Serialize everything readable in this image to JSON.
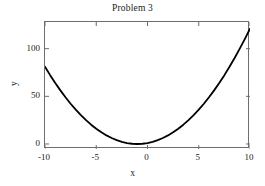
{
  "chart_data": {
    "type": "line",
    "title": "Problem 3",
    "xlabel": "x",
    "ylabel": "y",
    "xlim": [
      -10,
      10
    ],
    "ylim": [
      -5.25,
      128.0
    ],
    "xticks": [
      -10,
      -5,
      0,
      5,
      10
    ],
    "xtick_labels": [
      "-10",
      "-5",
      "0",
      "5",
      "10"
    ],
    "yticks": [
      0,
      50,
      100
    ],
    "ytick_labels": [
      "0",
      "50",
      "100"
    ],
    "grid": false,
    "legend": null,
    "series": [
      {
        "name": "y = (x + 1)^2",
        "color": "#000000",
        "linewidth": 1.8,
        "x": [
          -10,
          -9.5,
          -9,
          -8.5,
          -8,
          -7.5,
          -7,
          -6.5,
          -6,
          -5.5,
          -5,
          -4.5,
          -4,
          -3.5,
          -3,
          -2.5,
          -2,
          -1.5,
          -1,
          -0.5,
          0,
          0.5,
          1,
          1.5,
          2,
          2.5,
          3,
          3.5,
          4,
          4.5,
          5,
          5.5,
          6,
          6.5,
          7,
          7.5,
          8,
          8.5,
          9,
          9.5,
          10
        ],
        "values": [
          81,
          72.25,
          64,
          56.25,
          49,
          42.25,
          36,
          30.25,
          25,
          20.25,
          16,
          12.25,
          9,
          6.25,
          4,
          2.25,
          1,
          0.25,
          0,
          0.25,
          1,
          2.25,
          4,
          6.25,
          9,
          12.25,
          16,
          20.25,
          25,
          30.25,
          36,
          42.25,
          49,
          56.25,
          64,
          72.25,
          81,
          90.25,
          100,
          110.25,
          121
        ]
      }
    ]
  }
}
